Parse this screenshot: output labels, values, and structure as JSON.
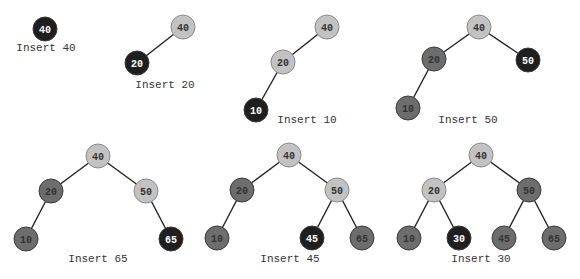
{
  "colors": {
    "new": "#1f1f1f",
    "path": "#c2c2c2",
    "other": "#6d6d6d",
    "edge": "#222222",
    "text_on_dark": "#ffffff",
    "text_on_light": "#333333"
  },
  "steps": [
    {
      "caption": "Insert 40",
      "caption_pos": [
        46,
        51
      ],
      "nodes": [
        {
          "id": "40",
          "label": "40",
          "x": 45,
          "y": 29,
          "style": "new"
        }
      ],
      "edges": []
    },
    {
      "caption": "Insert 20",
      "caption_pos": [
        165,
        88
      ],
      "nodes": [
        {
          "id": "40",
          "label": "40",
          "x": 183,
          "y": 27,
          "style": "path"
        },
        {
          "id": "20",
          "label": "20",
          "x": 137,
          "y": 63,
          "style": "new"
        }
      ],
      "edges": [
        [
          "40",
          "20"
        ]
      ]
    },
    {
      "caption": "Insert 10",
      "caption_pos": [
        307,
        123
      ],
      "nodes": [
        {
          "id": "40",
          "label": "40",
          "x": 327,
          "y": 27,
          "style": "path"
        },
        {
          "id": "20",
          "label": "20",
          "x": 283,
          "y": 62,
          "style": "path"
        },
        {
          "id": "10",
          "label": "10",
          "x": 256,
          "y": 110,
          "style": "new"
        }
      ],
      "edges": [
        [
          "40",
          "20"
        ],
        [
          "20",
          "10"
        ]
      ]
    },
    {
      "caption": "Insert 50",
      "caption_pos": [
        468,
        123
      ],
      "nodes": [
        {
          "id": "40",
          "label": "40",
          "x": 479,
          "y": 27,
          "style": "path"
        },
        {
          "id": "20",
          "label": "20",
          "x": 434,
          "y": 59,
          "style": "other"
        },
        {
          "id": "10",
          "label": "10",
          "x": 408,
          "y": 108,
          "style": "other"
        },
        {
          "id": "50",
          "label": "50",
          "x": 528,
          "y": 60,
          "style": "new"
        }
      ],
      "edges": [
        [
          "40",
          "20"
        ],
        [
          "20",
          "10"
        ],
        [
          "40",
          "50"
        ]
      ]
    },
    {
      "caption": "Insert 65",
      "caption_pos": [
        98,
        262
      ],
      "nodes": [
        {
          "id": "40",
          "label": "40",
          "x": 98,
          "y": 156,
          "style": "path"
        },
        {
          "id": "20",
          "label": "20",
          "x": 51,
          "y": 191,
          "style": "other"
        },
        {
          "id": "10",
          "label": "10",
          "x": 26,
          "y": 239,
          "style": "other"
        },
        {
          "id": "50",
          "label": "50",
          "x": 146,
          "y": 191,
          "style": "path"
        },
        {
          "id": "65",
          "label": "65",
          "x": 171,
          "y": 239,
          "style": "new"
        }
      ],
      "edges": [
        [
          "40",
          "20"
        ],
        [
          "20",
          "10"
        ],
        [
          "40",
          "50"
        ],
        [
          "50",
          "65"
        ]
      ]
    },
    {
      "caption": "Insert 45",
      "caption_pos": [
        290,
        262
      ],
      "nodes": [
        {
          "id": "40",
          "label": "40",
          "x": 289,
          "y": 155,
          "style": "path"
        },
        {
          "id": "20",
          "label": "20",
          "x": 242,
          "y": 190,
          "style": "other"
        },
        {
          "id": "10",
          "label": "10",
          "x": 217,
          "y": 238,
          "style": "other"
        },
        {
          "id": "50",
          "label": "50",
          "x": 337,
          "y": 190,
          "style": "path"
        },
        {
          "id": "45",
          "label": "45",
          "x": 312,
          "y": 238,
          "style": "new"
        },
        {
          "id": "65",
          "label": "65",
          "x": 362,
          "y": 238,
          "style": "other"
        }
      ],
      "edges": [
        [
          "40",
          "20"
        ],
        [
          "20",
          "10"
        ],
        [
          "40",
          "50"
        ],
        [
          "50",
          "45"
        ],
        [
          "50",
          "65"
        ]
      ]
    },
    {
      "caption": "Insert 30",
      "caption_pos": [
        481,
        262
      ],
      "nodes": [
        {
          "id": "40",
          "label": "40",
          "x": 481,
          "y": 155,
          "style": "path"
        },
        {
          "id": "20",
          "label": "20",
          "x": 434,
          "y": 190,
          "style": "path"
        },
        {
          "id": "10",
          "label": "10",
          "x": 409,
          "y": 238,
          "style": "other"
        },
        {
          "id": "30",
          "label": "30",
          "x": 459,
          "y": 238,
          "style": "new"
        },
        {
          "id": "50",
          "label": "50",
          "x": 529,
          "y": 190,
          "style": "other"
        },
        {
          "id": "45",
          "label": "45",
          "x": 504,
          "y": 238,
          "style": "other"
        },
        {
          "id": "65",
          "label": "65",
          "x": 554,
          "y": 238,
          "style": "other"
        }
      ],
      "edges": [
        [
          "40",
          "20"
        ],
        [
          "20",
          "10"
        ],
        [
          "20",
          "30"
        ],
        [
          "40",
          "50"
        ],
        [
          "50",
          "45"
        ],
        [
          "50",
          "65"
        ]
      ]
    }
  ]
}
